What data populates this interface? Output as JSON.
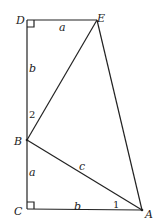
{
  "diagram": {
    "points": {
      "A": {
        "label": "A"
      },
      "B": {
        "label": "B"
      },
      "C": {
        "label": "C"
      },
      "D": {
        "label": "D"
      },
      "E": {
        "label": "E"
      }
    },
    "segment_labels": {
      "DE": "a",
      "DB": "b",
      "BC": "a",
      "CA": "b",
      "BA": "c"
    },
    "angle_labels": {
      "angle_at_B": "2",
      "angle_at_A": "1"
    },
    "right_angles": [
      "D",
      "C"
    ]
  }
}
